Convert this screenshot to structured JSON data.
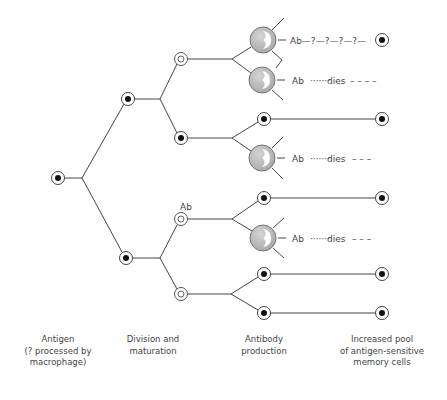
{
  "diagram": {
    "colors": {
      "line": "#444444",
      "cell_fill": "#b8b8b8",
      "cell_stroke": "#777777",
      "nucleus": "#ffffff",
      "dot": "#111111"
    },
    "labels": {
      "ab_top": "Ab",
      "ab_q_chain": "Ab—?—?—?—?—",
      "ab_dies_1_ab": "Ab",
      "ab_dies_1_dots": "·······",
      "ab_dies_1_dies": "dies",
      "ab_dies_1_dash": "– – – –",
      "ab_dies_2_ab": "Ab",
      "ab_dies_2_dots": "·······",
      "ab_dies_2_dies": "dies",
      "ab_dies_2_dash": "– – –",
      "ab_dies_3_ab": "Ab",
      "ab_dies_3_dots": "·······",
      "ab_dies_3_dies": "dies",
      "ab_dies_3_dash": "– – –",
      "ab_small": "Ab"
    },
    "captions": [
      {
        "line1": "Antigen",
        "line2": "(? processed by",
        "line3": "macrophage)"
      },
      {
        "line1": "Division and",
        "line2": "maturation",
        "line3": ""
      },
      {
        "line1": "Antibody",
        "line2": "production",
        "line3": ""
      },
      {
        "line1": "Increased pool",
        "line2": "of antigen-sensitive",
        "line3": "memory cells"
      }
    ],
    "nodes": [
      {
        "id": "antigen",
        "type": "sensitive",
        "x": 58,
        "y": 178
      },
      {
        "id": "gen1-top",
        "type": "sensitive",
        "x": 128,
        "y": 99
      },
      {
        "id": "gen1-bottom",
        "type": "sensitive",
        "x": 126,
        "y": 258
      },
      {
        "id": "gen2-a",
        "type": "maturing",
        "x": 181,
        "y": 59
      },
      {
        "id": "gen2-b",
        "type": "sensitive",
        "x": 181,
        "y": 138
      },
      {
        "id": "gen2-c",
        "type": "maturing",
        "x": 181,
        "y": 219
      },
      {
        "id": "gen2-d",
        "type": "maturing",
        "x": 181,
        "y": 294
      },
      {
        "id": "plasma-1",
        "type": "plasma",
        "x": 263,
        "y": 40
      },
      {
        "id": "plasma-2",
        "type": "plasma",
        "x": 262,
        "y": 80
      },
      {
        "id": "gen3-b1",
        "type": "sensitive",
        "x": 264,
        "y": 119
      },
      {
        "id": "plasma-3",
        "type": "plasma",
        "x": 262,
        "y": 158
      },
      {
        "id": "gen3-c1",
        "type": "sensitive",
        "x": 264,
        "y": 198
      },
      {
        "id": "plasma-4",
        "type": "plasma",
        "x": 263,
        "y": 238
      },
      {
        "id": "gen3-d1",
        "type": "sensitive",
        "x": 264,
        "y": 274
      },
      {
        "id": "gen3-d2",
        "type": "sensitive",
        "x": 264,
        "y": 313
      },
      {
        "id": "memory-1",
        "type": "sensitive",
        "x": 382,
        "y": 40
      },
      {
        "id": "memory-2",
        "type": "sensitive",
        "x": 382,
        "y": 119
      },
      {
        "id": "memory-3",
        "type": "sensitive",
        "x": 382,
        "y": 198
      },
      {
        "id": "memory-4",
        "type": "sensitive",
        "x": 382,
        "y": 274
      },
      {
        "id": "memory-5",
        "type": "sensitive",
        "x": 382,
        "y": 313
      }
    ]
  }
}
